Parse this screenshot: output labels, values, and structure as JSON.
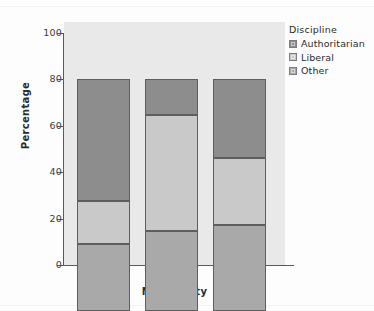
{
  "chart_data": {
    "type": "bar",
    "stacked": true,
    "title": "",
    "xlabel": "Nationality",
    "ylabel": "Percentage",
    "categories": [
      "British",
      "Dutch",
      "Australian"
    ],
    "ylim": [
      0,
      100
    ],
    "yticks": [
      0,
      20,
      40,
      60,
      80,
      100
    ],
    "ytick_labels": [
      "0",
      "20",
      "40",
      "60",
      "80",
      "100"
    ],
    "grid": false,
    "legend_position": "right",
    "legend_title": "Discipline",
    "stack_order_bottom_to_top": [
      "Other",
      "Liberal",
      "Authoritarian"
    ],
    "series": [
      {
        "name": "Authoritarian",
        "color": "#8d8d8d",
        "values": [
          52.5,
          15.5,
          34.0
        ]
      },
      {
        "name": "Liberal",
        "color": "#c9c9c9",
        "values": [
          18.5,
          50.0,
          29.0
        ]
      },
      {
        "name": "Other",
        "color": "#a9a9a9",
        "values": [
          29.0,
          34.5,
          37.0
        ]
      }
    ],
    "cumulative_tops": {
      "British": {
        "Other": 29.0,
        "Liberal": 47.5,
        "Authoritarian": 100.0
      },
      "Dutch": {
        "Other": 34.5,
        "Liberal": 84.5,
        "Authoritarian": 100.0
      },
      "Australian": {
        "Other": 37.0,
        "Liberal": 66.0,
        "Authoritarian": 100.0
      }
    }
  },
  "legend": {
    "title": "Discipline",
    "items": [
      {
        "label": "Authoritarian",
        "color": "#8d8d8d"
      },
      {
        "label": "Liberal",
        "color": "#c9c9c9"
      },
      {
        "label": "Other",
        "color": "#a9a9a9"
      }
    ]
  },
  "axes": {
    "y_title": "Percentage",
    "x_title": "Nationality",
    "y_ticks": [
      "100",
      "80",
      "60",
      "40",
      "20",
      "0"
    ],
    "x_ticks": [
      "British",
      "Dutch",
      "Australian"
    ]
  },
  "colors": {
    "panel_background": "#e9e9e9",
    "page_background": "#fdfdfd",
    "axis": "#5a5a5a",
    "text": "#2b2b2b",
    "authoritarian": "#8d8d8d",
    "liberal": "#c9c9c9",
    "other": "#a9a9a9"
  }
}
